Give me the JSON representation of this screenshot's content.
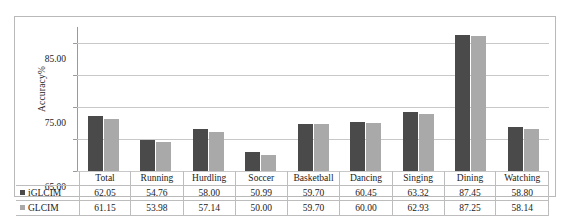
{
  "chart_data": {
    "type": "bar",
    "title": "",
    "xlabel": "",
    "ylabel": "Accuracy%",
    "ylim": [
      45.0,
      90.0
    ],
    "yticks": [
      "45.00",
      "55.00",
      "65.00",
      "75.00",
      "85.00"
    ],
    "grid": true,
    "legend_position": "data-table-row-headers",
    "categories": [
      "Total",
      "Running",
      "Hurdling",
      "Soccer",
      "Basketball",
      "Dancing",
      "Singing",
      "Dining",
      "Watching"
    ],
    "series": [
      {
        "name": "iGLCIM",
        "color": "#4a4a4a",
        "values": [
          62.05,
          54.76,
          58.0,
          50.99,
          59.7,
          60.45,
          63.32,
          87.45,
          58.8
        ],
        "labels": [
          "62.05",
          "54.76",
          "58.00",
          "50.99",
          "59.70",
          "60.45",
          "63.32",
          "87.45",
          "58.80"
        ]
      },
      {
        "name": "GLCIM",
        "color": "#a9a9a9",
        "values": [
          61.15,
          53.98,
          57.14,
          50.0,
          59.7,
          60.0,
          62.93,
          87.25,
          58.14
        ],
        "labels": [
          "61.15",
          "53.98",
          "57.14",
          "50.00",
          "59.70",
          "60.00",
          "62.93",
          "87.25",
          "58.14"
        ]
      }
    ]
  }
}
